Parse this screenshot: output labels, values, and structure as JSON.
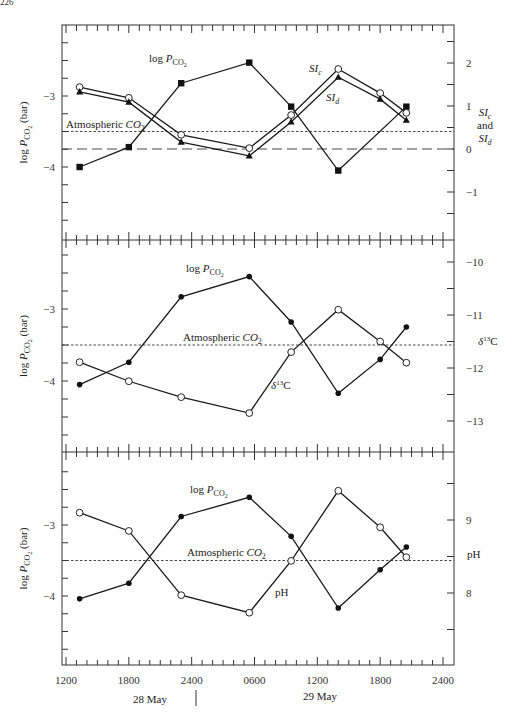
{
  "page_number": "226",
  "chart_data": [
    {
      "type": "line",
      "panel": "top",
      "xlabel_day_1": "28 May",
      "xlabel_day_2": "29 May",
      "x_unit": "hours since 1200 on 28 May",
      "xlim": [
        0,
        36
      ],
      "left_axis": {
        "label": "log P_CO2 (bar)",
        "ylim": [
          -5,
          -2
        ],
        "ticks": [
          -3,
          -4
        ],
        "tick_labels": [
          "-3",
          "-4"
        ]
      },
      "right_axis": {
        "label": "SI_c and SI_d",
        "ylim": [
          -1.8,
          2.5
        ],
        "ticks": [
          2,
          1,
          0,
          -1
        ],
        "tick_labels": [
          "2",
          "1",
          "0",
          "-1"
        ]
      },
      "series": [
        {
          "name": "log P_CO2",
          "label": "log P_CO2",
          "axis": "left",
          "marker": "filled-square",
          "x": [
            1.3,
            6,
            11,
            17.5,
            21.5,
            26,
            32.5
          ],
          "values": [
            -4.0,
            -3.72,
            -2.82,
            -2.53,
            -3.15,
            -4.05,
            -3.15
          ]
        },
        {
          "name": "SIc",
          "label": "SI_c",
          "axis": "right",
          "marker": "open-circle",
          "x": [
            1.3,
            6,
            11,
            17.5,
            21.5,
            26,
            30,
            32.5
          ],
          "values": [
            1.44,
            1.19,
            0.33,
            0.02,
            0.79,
            1.86,
            1.3,
            0.84
          ]
        },
        {
          "name": "SId",
          "label": "SI_d",
          "axis": "right",
          "marker": "filled-triangle",
          "x": [
            1.3,
            6,
            11,
            17.5,
            21.5,
            26,
            30,
            32.5
          ],
          "values": [
            1.33,
            1.09,
            0.16,
            -0.16,
            0.63,
            1.67,
            1.16,
            0.67
          ]
        }
      ],
      "reference_lines": [
        {
          "label": "Atmospheric CO2",
          "axis": "left",
          "value": -3.5,
          "style": "dotted"
        },
        {
          "label": "SI = 0",
          "axis": "right",
          "value": 0,
          "style": "dashed"
        }
      ]
    },
    {
      "type": "line",
      "panel": "middle",
      "xlim": [
        0,
        36
      ],
      "left_axis": {
        "label": "log P_CO2 (bar)",
        "ylim": [
          -5,
          -2
        ],
        "ticks": [
          -3,
          -4
        ],
        "tick_labels": [
          "-3",
          "-4"
        ]
      },
      "right_axis": {
        "label": "δ13C",
        "ylim": [
          -13.6,
          -9.7
        ],
        "ticks": [
          -10,
          -11,
          -12,
          -13
        ],
        "tick_labels": [
          "-10",
          "-11",
          "-12",
          "-13"
        ]
      },
      "series": [
        {
          "name": "log P_CO2",
          "label": "log P_CO2",
          "axis": "left",
          "marker": "filled-circle",
          "x": [
            1.3,
            6,
            11,
            17.5,
            21.5,
            26,
            30,
            32.5
          ],
          "values": [
            -4.05,
            -3.74,
            -2.83,
            -2.55,
            -3.18,
            -4.17,
            -3.7,
            -3.25
          ]
        },
        {
          "name": "δ13C",
          "label": "δ13C",
          "axis": "right",
          "marker": "open-circle",
          "x": [
            1.3,
            6,
            11,
            17.5,
            21.5,
            26,
            30,
            32.5
          ],
          "values": [
            -11.89,
            -12.25,
            -12.55,
            -12.85,
            -11.7,
            -10.9,
            -11.5,
            -11.9
          ]
        }
      ],
      "reference_lines": [
        {
          "label": "Atmospheric CO2",
          "axis": "left",
          "value": -3.5,
          "style": "dotted"
        }
      ]
    },
    {
      "type": "line",
      "panel": "bottom",
      "xlim": [
        0,
        36
      ],
      "x_ticks": [
        0,
        6,
        12,
        18,
        24,
        30,
        36
      ],
      "x_tick_labels": [
        "1200",
        "1800",
        "2400",
        "0600",
        "1200",
        "1800",
        "2400"
      ],
      "left_axis": {
        "label": "log P_CO2 (bar)",
        "ylim": [
          -5,
          -2
        ],
        "ticks": [
          -3,
          -4
        ],
        "tick_labels": [
          "-3",
          "-4"
        ]
      },
      "right_axis": {
        "label": "pH",
        "ylim": [
          7.0,
          10.0
        ],
        "ticks": [
          9,
          8
        ],
        "tick_labels": [
          "9",
          "8"
        ]
      },
      "series": [
        {
          "name": "log P_CO2",
          "label": "log P_CO2",
          "axis": "left",
          "marker": "filled-circle",
          "x": [
            1.3,
            6,
            11,
            17.5,
            21.5,
            26,
            30,
            32.5
          ],
          "values": [
            -4.04,
            -3.82,
            -2.88,
            -2.61,
            -3.16,
            -4.17,
            -3.63,
            -3.31
          ]
        },
        {
          "name": "pH",
          "label": "pH",
          "axis": "right",
          "marker": "open-circle",
          "x": [
            1.3,
            6,
            11,
            17.5,
            21.5,
            26,
            30,
            32.5
          ],
          "values": [
            9.1,
            8.85,
            7.97,
            7.73,
            8.44,
            9.4,
            8.9,
            8.49
          ]
        }
      ],
      "reference_lines": [
        {
          "label": "Atmospheric CO2",
          "axis": "left",
          "value": -3.5,
          "style": "dotted"
        }
      ]
    }
  ],
  "labels": {
    "y_left": "log P",
    "y_left_sub": "CO",
    "y_left_sub2": "2",
    "y_left_unit": " (bar)",
    "logp": "log P",
    "logp_sub": "CO",
    "logp_sub2": "2",
    "atm": "Atmospheric CO",
    "atm_sub": "2",
    "sic": "SI",
    "sic_sub": "c",
    "sid": "SI",
    "sid_sub": "d",
    "and": "and",
    "d13c_delta": "δ",
    "d13c_sup": "13",
    "d13c_c": "C",
    "ph": "pH",
    "day1": "28 May",
    "day2": "29 May"
  }
}
